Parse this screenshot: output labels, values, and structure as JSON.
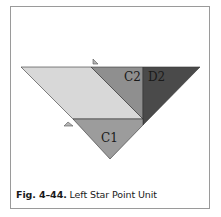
{
  "figure": {
    "number": "Fig. 4–44.",
    "title": "Left Star Point Unit"
  },
  "labels": {
    "c2": "C2",
    "d2": "D2",
    "c1": "C1"
  },
  "colors": {
    "light_piece": "#d8d8d8",
    "c2_piece": "#8f8f8f",
    "d2_piece": "#4a4a4a",
    "c1_piece": "#9c9c9c",
    "border": "#9a9a9a",
    "marker": "#b5b5b5"
  }
}
